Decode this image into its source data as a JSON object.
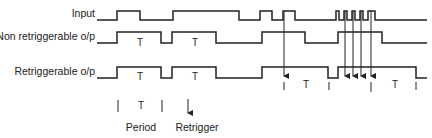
{
  "signals": [
    {
      "name": "input",
      "label": "Input"
    },
    {
      "name": "non-retriggerable-output",
      "label": "Non retriggerable o/p"
    },
    {
      "name": "retriggerable-output",
      "label": "Retriggerable o/p"
    }
  ],
  "period_marker": "T",
  "legend": {
    "period_symbol": "T",
    "period_label": "Period",
    "retrigger_label": "Retrigger"
  },
  "colors": {
    "line": "#222222",
    "background": "#ffffff"
  }
}
